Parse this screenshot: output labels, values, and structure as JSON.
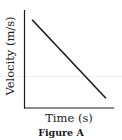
{
  "figure": {
    "caption": "Figure A"
  },
  "chart_data": {
    "type": "line",
    "title": "",
    "xlabel": "Time (s)",
    "ylabel": "Velocity (m/s)",
    "x": [
      0.09,
      0.91
    ],
    "y": [
      0.9,
      0.1
    ],
    "series": [
      {
        "name": "velocity",
        "x": [
          0.09,
          0.91
        ],
        "y": [
          0.9,
          0.1
        ]
      }
    ],
    "xlim": [
      0,
      1
    ],
    "ylim": [
      0,
      1
    ],
    "ticks": "none",
    "grid": false,
    "legend": "none",
    "colors": {
      "line": "#1a1a1a",
      "axes": "#1a1a1a"
    }
  }
}
